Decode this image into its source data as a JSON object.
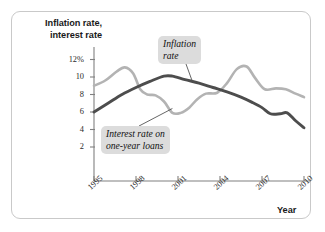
{
  "figure": {
    "y_axis_title_line1": "Inflation rate,",
    "y_axis_title_line2": "interest rate",
    "x_axis_title": "Year",
    "callout_inflation_line1": "Inflation",
    "callout_inflation_line2": "rate",
    "callout_interest_line1": "Interest rate on",
    "callout_interest_line2": "one-year loans",
    "colors": {
      "inflation_line": "#4d4d4d",
      "interest_line": "#b3b3b3",
      "axis": "#808080",
      "callout_background": "#dcdcdc",
      "frame_border": "#c9c9c9",
      "text": "#1a1a1a"
    }
  },
  "chart_data": {
    "type": "line",
    "title": "",
    "subtitle": "",
    "xlabel": "Year",
    "ylabel": "Inflation rate, interest rate",
    "xlim": [
      1995,
      2010
    ],
    "ylim": [
      0,
      13
    ],
    "grid": false,
    "legend_position": "inline-callouts",
    "xticks": [
      1995,
      1998,
      2001,
      2004,
      2007,
      2010
    ],
    "xtick_labels": [
      "1995",
      "1998",
      "2001",
      "2004",
      "2007",
      "2010"
    ],
    "yticks": [
      2,
      4,
      6,
      8,
      10,
      12
    ],
    "ytick_labels": [
      "2",
      "4",
      "6",
      "8",
      "10",
      "12%"
    ],
    "annotations": [
      {
        "text": "Inflation rate",
        "target_series": "Inflation rate",
        "target_x": 2002.0,
        "target_y": 9.6
      },
      {
        "text": "Interest rate on one-year loans",
        "target_series": "Interest rate on one-year loans",
        "target_x": 2000.6,
        "target_y": 6.4
      }
    ],
    "series": [
      {
        "name": "Inflation rate",
        "color": "#4d4d4d",
        "x": [
          1995.0,
          1996.0,
          1997.0,
          1998.0,
          1999.0,
          2000.0,
          2000.6,
          2001.5,
          2002.5,
          2003.5,
          2004.5,
          2005.5,
          2006.3,
          2007.0,
          2007.6,
          2008.3,
          2008.8,
          2009.4,
          2010.0
        ],
        "values": [
          6.0,
          7.0,
          8.0,
          8.8,
          9.5,
          10.1,
          10.1,
          9.7,
          9.3,
          8.8,
          8.3,
          7.7,
          7.1,
          6.5,
          5.8,
          5.8,
          5.9,
          5.0,
          4.2
        ]
      },
      {
        "name": "Interest rate on one-year loans",
        "color": "#b3b3b3",
        "x": [
          1995.0,
          1995.8,
          1996.6,
          1997.2,
          1997.8,
          1998.3,
          1998.8,
          1999.4,
          2000.0,
          2000.6,
          2001.2,
          2001.8,
          2002.4,
          2003.0,
          2003.8,
          2004.5,
          2005.2,
          2005.9,
          2006.5,
          2007.2,
          2008.0,
          2008.7,
          2009.4,
          2010.0
        ],
        "values": [
          9.0,
          9.6,
          10.6,
          11.1,
          10.4,
          8.6,
          8.0,
          7.9,
          7.2,
          5.9,
          5.9,
          6.5,
          7.5,
          8.1,
          8.2,
          9.3,
          10.9,
          11.2,
          9.9,
          8.6,
          8.7,
          8.6,
          8.1,
          7.7
        ]
      }
    ]
  }
}
